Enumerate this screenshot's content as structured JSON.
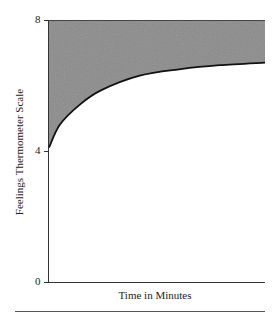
{
  "chart_data": {
    "type": "area",
    "title": "",
    "xlabel": "Time in Minutes",
    "ylabel": "Feelings Thermometer Scale",
    "ylim": [
      0,
      8
    ],
    "yticks": [
      0,
      4,
      8
    ],
    "ytick_labels": [
      "0",
      "4",
      "8"
    ],
    "xticks": [],
    "grid": false,
    "legend": null,
    "series": [
      {
        "name": "curve",
        "x": [
          0,
          0.05,
          0.14,
          0.24,
          0.42,
          0.61,
          0.79,
          1.0
        ],
        "y": [
          4.1,
          4.8,
          5.4,
          5.85,
          6.3,
          6.5,
          6.62,
          6.7
        ]
      }
    ],
    "shaded_region": {
      "between": [
        "curve",
        8
      ],
      "fill": "#8a8a8a"
    },
    "curve_color": "#111111"
  },
  "axes": {
    "ytick_0": "0",
    "ytick_4": "4",
    "ytick_8": "8"
  }
}
